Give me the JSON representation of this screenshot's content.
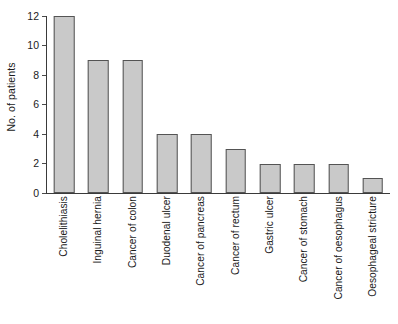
{
  "chart_data": {
    "type": "bar",
    "title": "",
    "subtitle": "",
    "xlabel": "",
    "ylabel": "No. of patients",
    "ylim": [
      0,
      12
    ],
    "yticks": [
      0,
      2,
      4,
      6,
      8,
      10,
      12
    ],
    "ytick_labels": [
      "0",
      "2",
      "4",
      "6",
      "8",
      "10",
      "12"
    ],
    "grid": false,
    "legend": null,
    "orientation": "vertical",
    "bar_fill_color": "#c9c9c9",
    "bar_edge_color": "#545454",
    "background_color": "#ffffff",
    "axis_color": "#3a3a3a",
    "xtick_label_rotation": 90,
    "categories": [
      "Cholelithiasis",
      "Inguinal hernia",
      "Cancer of colon",
      "Duodenal ulcer",
      "Cancer of pancreas",
      "Cancer of rectum",
      "Gastric ulcer",
      "Cancer of stomach",
      "Cancer of oesophagus",
      "Oesophageal stricture"
    ],
    "values": [
      12,
      9,
      9,
      4,
      4,
      3,
      2,
      2,
      2,
      1
    ]
  }
}
